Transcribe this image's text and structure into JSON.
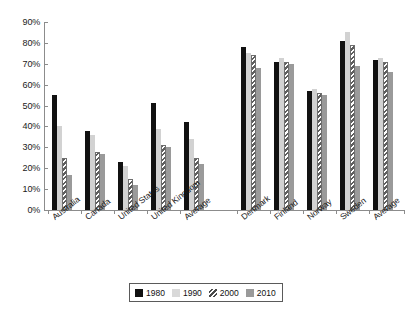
{
  "chart_data": {
    "type": "bar",
    "title": "",
    "xlabel": "",
    "ylabel": "",
    "ylim": [
      0,
      90
    ],
    "ytick_labels": [
      "90%",
      "80%",
      "70%",
      "60%",
      "50%",
      "40%",
      "30%",
      "20%",
      "10%",
      "0%"
    ],
    "ytick_values": [
      90,
      80,
      70,
      60,
      50,
      40,
      30,
      20,
      10,
      0
    ],
    "grid": false,
    "legend_position": "bottom",
    "categories": [
      "Australia",
      "Canada",
      "United States",
      "United Kingdom",
      "Average",
      "Denmark",
      "Finland",
      "Norway",
      "Sweden",
      "Average"
    ],
    "series": [
      {
        "name": "1980",
        "color": "#111111",
        "values": [
          55,
          38,
          23,
          51,
          42,
          78,
          71,
          57,
          81,
          72
        ]
      },
      {
        "name": "1990",
        "color": "#d2d2d2",
        "values": [
          40,
          36,
          21,
          39,
          34,
          75,
          73,
          58,
          85,
          73
        ]
      },
      {
        "name": "2000",
        "color": "#5e5e5e",
        "values": [
          25,
          28,
          15,
          31,
          25,
          74,
          71,
          56,
          79,
          71
        ]
      },
      {
        "name": "2010",
        "color": "#9a9a9a",
        "values": [
          17,
          27,
          12,
          30,
          22,
          68,
          70,
          55,
          69,
          66
        ]
      }
    ]
  },
  "legend": {
    "items": [
      {
        "label": "1980"
      },
      {
        "label": "1990"
      },
      {
        "label": "2000"
      },
      {
        "label": "2010"
      }
    ]
  }
}
